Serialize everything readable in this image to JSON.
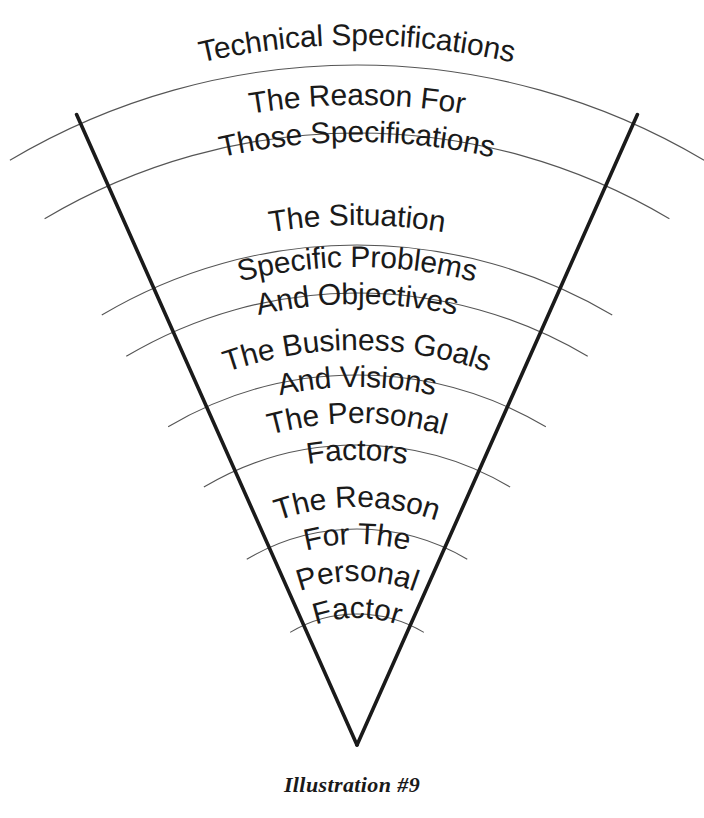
{
  "figure": {
    "caption": "Illustration #9",
    "background_color": "#ffffff",
    "line_color": "#1a1a1a",
    "arc_color": "#555555",
    "text_color": "#1a1a1a",
    "shape": "inverted-cone",
    "apex": {
      "x": 357,
      "y": 745
    },
    "bands": [
      {
        "index": 1,
        "lines": [
          "Technical Specifications"
        ],
        "arc_radius": 680,
        "text_radius": 700,
        "font_size": 30
      },
      {
        "index": 2,
        "lines": [
          "The Reason For",
          "Those Specifications"
        ],
        "arc_radius": 612,
        "text_radius": 640,
        "font_size": 30
      },
      {
        "index": 3,
        "lines": [
          "The Situation"
        ],
        "arc_radius": 500,
        "text_radius": 520,
        "font_size": 30
      },
      {
        "index": 4,
        "lines": [
          "Specific Problems",
          "And Objectives"
        ],
        "arc_radius": 452,
        "text_radius": 478,
        "font_size": 30
      },
      {
        "index": 5,
        "lines": [
          "The Business Goals",
          "And Visions"
        ],
        "arc_radius": 370,
        "text_radius": 395,
        "font_size": 30
      },
      {
        "index": 6,
        "lines": [
          "The Personal",
          "Factors"
        ],
        "arc_radius": 300,
        "text_radius": 322,
        "font_size": 30
      },
      {
        "index": 7,
        "lines": [
          "The Reason",
          "For The",
          "Personal",
          "Factor"
        ],
        "arc_radius": 216,
        "text_radius": 238,
        "font_size": 30
      }
    ],
    "bottom_arc_radius": 131
  },
  "chart_data": {
    "type": "diagram",
    "diagram_kind": "inverted-cone-funnel",
    "title": "",
    "caption": "Illustration #9",
    "orientation": "top-wide-to-bottom-narrow",
    "level_count": 7,
    "levels": [
      {
        "level": 1,
        "position": "top",
        "label": "Technical Specifications"
      },
      {
        "level": 2,
        "position": "2nd",
        "label": "The Reason For Those Specifications"
      },
      {
        "level": 3,
        "position": "3rd",
        "label": "The Situation"
      },
      {
        "level": 4,
        "position": "4th",
        "label": "Specific Problems And Objectives"
      },
      {
        "level": 5,
        "position": "5th",
        "label": "The Business Goals And Visions"
      },
      {
        "level": 6,
        "position": "6th",
        "label": "The Personal Factors"
      },
      {
        "level": 7,
        "position": "bottom",
        "label": "The Reason For The Personal Factor"
      }
    ]
  }
}
